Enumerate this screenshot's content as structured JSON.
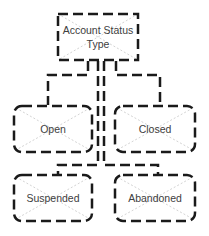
{
  "diagram": {
    "type": "tree",
    "colors": {
      "stroke": "#1a1a1a",
      "cross": "#c8c8c8",
      "text": "#404040"
    },
    "root": {
      "label": "Account Status Type"
    },
    "children": [
      {
        "label": "Open"
      },
      {
        "label": "Closed"
      },
      {
        "label": "Suspended"
      },
      {
        "label": "Abandoned"
      }
    ],
    "edges": [
      {
        "from": "Account Status Type",
        "to": "Open"
      },
      {
        "from": "Account Status Type",
        "to": "Closed"
      },
      {
        "from": "Account Status Type",
        "to": "Suspended"
      },
      {
        "from": "Account Status Type",
        "to": "Abandoned"
      }
    ]
  }
}
